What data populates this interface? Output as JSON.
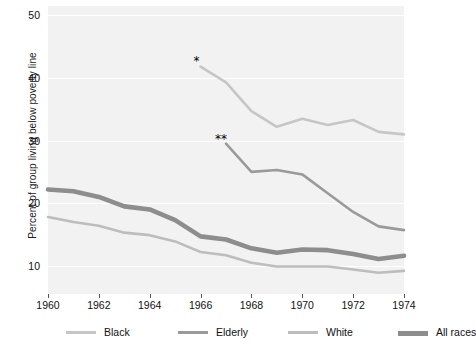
{
  "chart_data": {
    "type": "line",
    "title": "",
    "xlabel": "",
    "ylabel": "Percent of group living below poverty line",
    "xlim": [
      1960,
      1974
    ],
    "ylim": [
      5.5,
      51.5
    ],
    "grid": "horizontal-white",
    "legend_position": "bottom",
    "ytick_labels": [
      "50",
      "40",
      "30",
      "20",
      "10"
    ],
    "ytick_values": [
      50,
      40,
      30,
      20,
      10
    ],
    "xtick_labels": [
      "1960",
      "1962",
      "1964",
      "1966",
      "1968",
      "1970",
      "1972",
      "1974"
    ],
    "xtick_values": [
      1960,
      1962,
      1964,
      1966,
      1968,
      1970,
      1972,
      1974
    ],
    "annotations": [
      {
        "text": "*",
        "x": 1965.8,
        "y": 43.4,
        "note": "marker at start of Black series"
      },
      {
        "text": "**",
        "x": 1966.8,
        "y": 30.9,
        "note": "marker at start of Elderly series"
      }
    ],
    "series": [
      {
        "name": "Black",
        "color": "#c6c6c6",
        "width": 2.6,
        "x": [
          1966,
          1967,
          1968,
          1969,
          1970,
          1971,
          1972,
          1973,
          1974
        ],
        "values": [
          41.8,
          39.3,
          34.7,
          32.2,
          33.5,
          32.5,
          33.3,
          31.4,
          31.0
        ]
      },
      {
        "name": "Elderly",
        "color": "#9a9a9a",
        "width": 2.6,
        "x": [
          1967,
          1968,
          1969,
          1970,
          1971,
          1972,
          1973,
          1974
        ],
        "values": [
          29.5,
          25.0,
          25.3,
          24.6,
          21.6,
          18.6,
          16.3,
          15.7
        ]
      },
      {
        "name": "White",
        "color": "#bdbdbd",
        "width": 2.6,
        "x": [
          1960,
          1961,
          1962,
          1963,
          1964,
          1965,
          1966,
          1967,
          1968,
          1969,
          1970,
          1971,
          1972,
          1973,
          1974
        ],
        "values": [
          17.8,
          17.0,
          16.4,
          15.3,
          14.9,
          13.9,
          12.2,
          11.7,
          10.5,
          9.9,
          9.9,
          9.9,
          9.4,
          8.9,
          9.2
        ]
      },
      {
        "name": "All races",
        "color": "#8d8d8d",
        "width": 4.6,
        "x": [
          1960,
          1961,
          1962,
          1963,
          1964,
          1965,
          1966,
          1967,
          1968,
          1969,
          1970,
          1971,
          1972,
          1973,
          1974
        ],
        "values": [
          22.2,
          21.9,
          21.0,
          19.5,
          19.0,
          17.3,
          14.7,
          14.2,
          12.8,
          12.1,
          12.6,
          12.5,
          11.9,
          11.1,
          11.6
        ]
      }
    ]
  },
  "legend": {
    "items": [
      {
        "label": "Black",
        "color": "#c6c6c6",
        "thickness": 3
      },
      {
        "label": "Elderly",
        "color": "#9a9a9a",
        "thickness": 3
      },
      {
        "label": "White",
        "color": "#bdbdbd",
        "thickness": 3
      },
      {
        "label": "All races",
        "color": "#8d8d8d",
        "thickness": 5
      }
    ]
  }
}
